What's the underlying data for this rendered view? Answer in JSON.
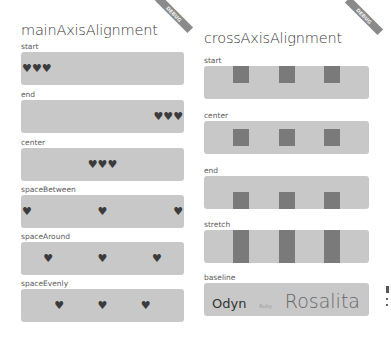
{
  "colors": {
    "box_bg": "#c8c8c8",
    "heart": "#3b3b3b",
    "square": "#7a7a7a",
    "banner": "#8a8a8a"
  },
  "left_panel": {
    "title": "mainAxisAlignment",
    "banner": "DEBUG",
    "icon": "heart-icon",
    "heart_glyph": "♥",
    "rows": [
      {
        "label": "start",
        "justify": "flex-start"
      },
      {
        "label": "end",
        "justify": "flex-end"
      },
      {
        "label": "center",
        "justify": "center"
      },
      {
        "label": "spaceBetween",
        "justify": "space-between"
      },
      {
        "label": "spaceAround",
        "justify": "space-around"
      },
      {
        "label": "spaceEvenly",
        "justify": "space-evenly"
      }
    ]
  },
  "right_panel": {
    "title": "crossAxisAlignment",
    "banner": "DEBUG",
    "rows": [
      {
        "label": "start",
        "align": "flex-start"
      },
      {
        "label": "center",
        "align": "center"
      },
      {
        "label": "end",
        "align": "flex-end"
      },
      {
        "label": "stretch",
        "align": "stretch"
      },
      {
        "label": "baseline",
        "align": "baseline"
      }
    ],
    "baseline_words": [
      "Odyn",
      "Ruby",
      "Rosalita"
    ]
  }
}
